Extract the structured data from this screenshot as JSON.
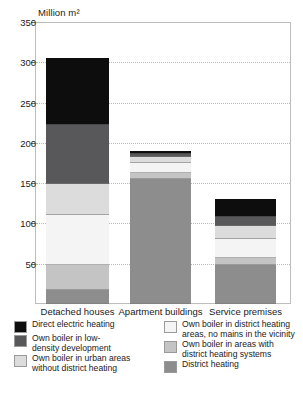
{
  "axis": {
    "y_title": "Million m²",
    "y_ticks": [
      "350",
      "300",
      "250",
      "200",
      "150",
      "100",
      "50"
    ],
    "y_min": 0,
    "y_max": 350
  },
  "categories": [
    {
      "label": "Detached houses"
    },
    {
      "label": "Apartment buildings"
    },
    {
      "label": "Service premises"
    }
  ],
  "legend": {
    "left": [
      {
        "name": "direct-electric-heating",
        "color": "#0d0d0d",
        "line1": "Direct electric heating",
        "line2": ""
      },
      {
        "name": "own-boiler-low-density",
        "color": "#58585a",
        "line1": "Own boiler in low-",
        "line2": "density development"
      },
      {
        "name": "own-boiler-urban-no-dh",
        "color": "#dcdcdc",
        "line1": "Own boiler in urban areas",
        "line2": "without district heating"
      }
    ],
    "right": [
      {
        "name": "own-boiler-dh-area-no-mains",
        "color": "#f4f4f4",
        "line1": "Own boiler in district heating",
        "line2": "areas, no mains in the vicinity"
      },
      {
        "name": "own-boiler-areas-with-dh",
        "color": "#c4c4c4",
        "line1": "Own boiler in areas with",
        "line2": "district heating systems"
      },
      {
        "name": "district-heating",
        "color": "#8d8d8d",
        "line1": "District heating",
        "line2": ""
      }
    ]
  },
  "chart_data": {
    "type": "bar",
    "stacked": true,
    "title": "",
    "xlabel": "",
    "ylabel": "Million m²",
    "ylim": [
      0,
      350
    ],
    "ytick_step": 50,
    "grid": true,
    "legend_position": "bottom",
    "categories": [
      "Detached houses",
      "Apartment buildings",
      "Service premises"
    ],
    "series": [
      {
        "name": "District heating",
        "color": "#8d8d8d",
        "values": [
          17,
          155,
          48
        ]
      },
      {
        "name": "Own boiler in areas with district heating systems",
        "color": "#c4c4c4",
        "values": [
          31,
          8,
          9
        ]
      },
      {
        "name": "Own boiler in district heating areas, no mains in the vicinity",
        "color": "#f4f4f4",
        "values": [
          62,
          12,
          24
        ]
      },
      {
        "name": "Own boiler in urban areas without district heating",
        "color": "#dcdcdc",
        "values": [
          39,
          7,
          16
        ]
      },
      {
        "name": "Own boiler in low-density development",
        "color": "#58585a",
        "values": [
          73,
          4,
          11
        ]
      },
      {
        "name": "Direct electric heating",
        "color": "#0d0d0d",
        "values": [
          83,
          4,
          22
        ]
      }
    ],
    "totals": [
      305,
      190,
      130
    ]
  }
}
